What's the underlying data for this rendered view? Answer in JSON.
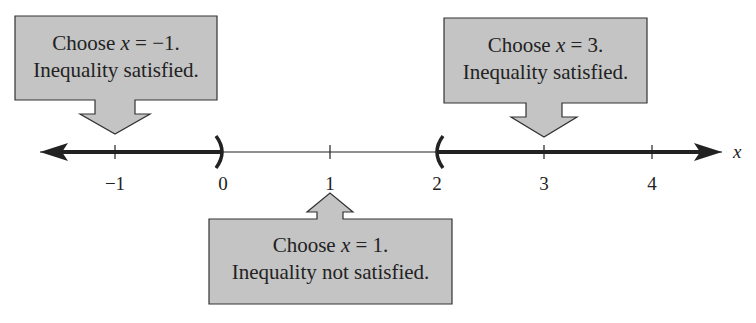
{
  "diagram": {
    "type": "number-line",
    "variable": "x",
    "ticks": [
      {
        "value": -1,
        "label": "−1"
      },
      {
        "value": 0,
        "label": "0"
      },
      {
        "value": 1,
        "label": "1"
      },
      {
        "value": 2,
        "label": "2"
      },
      {
        "value": 3,
        "label": "3"
      },
      {
        "value": 4,
        "label": "4"
      }
    ],
    "intervals": [
      {
        "from": "-inf",
        "to": 0,
        "open_end": true,
        "shaded": true
      },
      {
        "from": 2,
        "to": "inf",
        "open_start": true,
        "shaded": true
      }
    ],
    "callouts": [
      {
        "id": "left",
        "line1_prefix": "Choose ",
        "var": "x",
        "line1_suffix": " = −1.",
        "line2": "Inequality satisfied.",
        "points_to": -1
      },
      {
        "id": "middle",
        "line1_prefix": "Choose ",
        "var": "x",
        "line1_suffix": " = 1.",
        "line2": "Inequality not satisfied.",
        "points_to": 1
      },
      {
        "id": "right",
        "line1_prefix": "Choose ",
        "var": "x",
        "line1_suffix": " = 3.",
        "line2": "Inequality satisfied.",
        "points_to": 3
      }
    ],
    "colors": {
      "callout_fill": "#c4c4c4",
      "callout_stroke": "#333333",
      "line": "#222222"
    }
  }
}
